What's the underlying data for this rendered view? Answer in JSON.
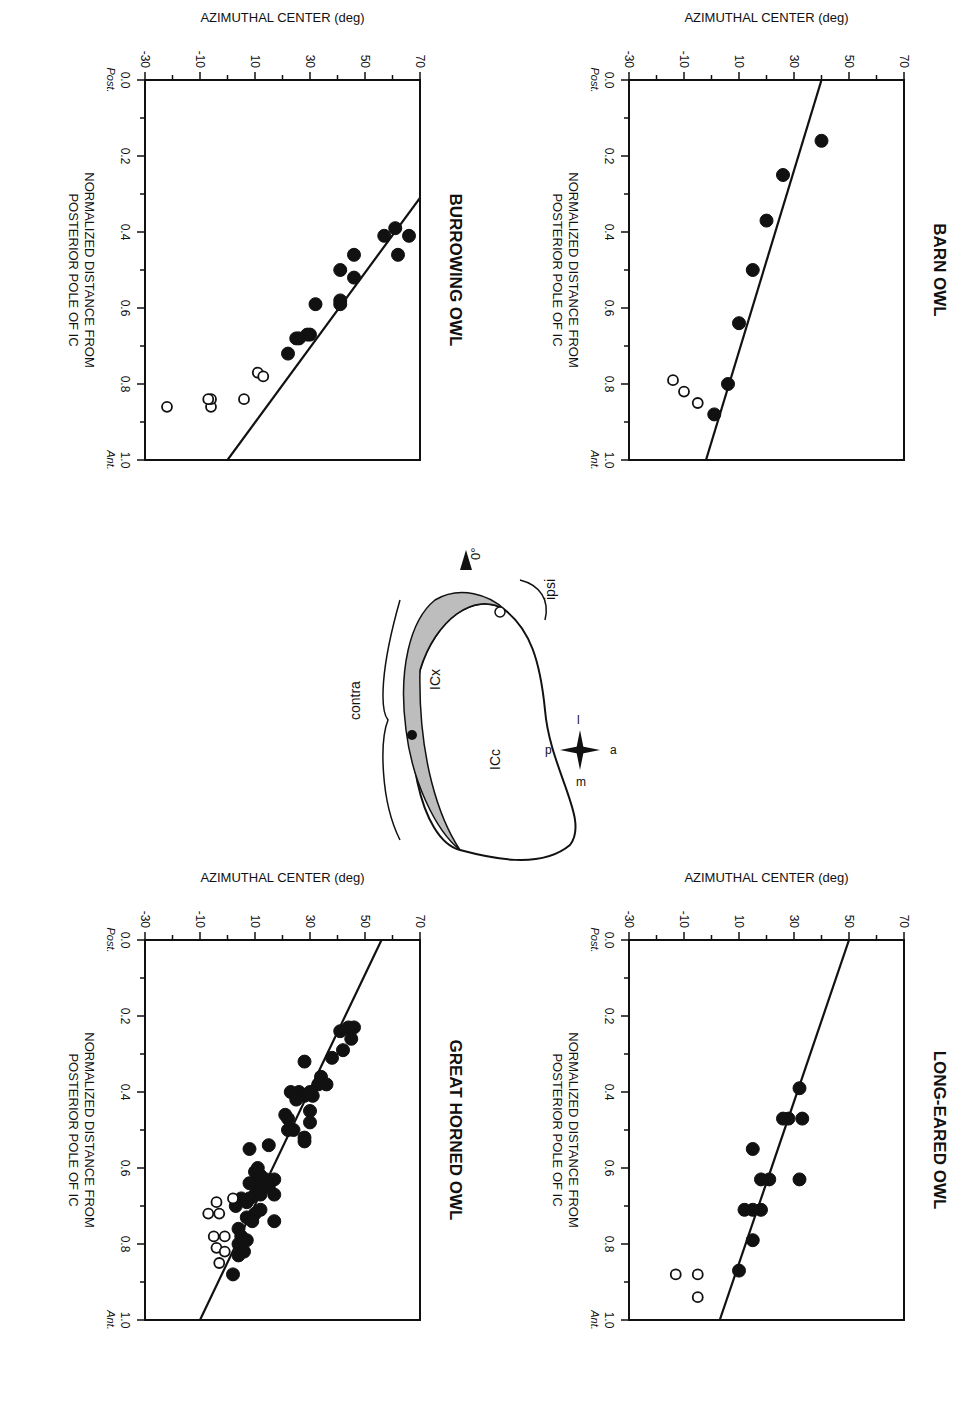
{
  "figure": {
    "orientation": "rotated 90deg clockwise",
    "panels_order": [
      "burrowing_owl",
      "barn_owl",
      "great_horned_owl",
      "long_eared_owl"
    ]
  },
  "axes": {
    "ylabel": "AZIMUTHAL CENTER (deg)",
    "xlabel_line1": "NORMALIZED DISTANCE FROM",
    "xlabel_line2": "POSTERIOR POLE OF IC",
    "y_ticks": [
      "70",
      "50",
      "30",
      "10",
      "-10",
      "-30"
    ],
    "x_ticks": [
      "0.0",
      "0.2",
      "0.4",
      "0.6",
      "0.8",
      "1.0"
    ],
    "x_start_label": "Post.",
    "x_end_label": "Ant."
  },
  "schematic": {
    "contra": "contra",
    "ipsi": "ipsi",
    "icx": "ICx",
    "icc": "ICc",
    "zero_deg": "0°",
    "compass": {
      "a": "a",
      "p": "p",
      "l": "l",
      "m": "m"
    }
  },
  "chart_data": [
    {
      "id": "burrowing_owl",
      "type": "scatter",
      "title": "BURROWING OWL",
      "xlabel": "NORMALIZED DISTANCE FROM POSTERIOR POLE OF IC",
      "ylabel": "AZIMUTHAL CENTER (deg)",
      "xlim": [
        0,
        1
      ],
      "ylim": [
        -30,
        70
      ],
      "x_ticks": [
        0.0,
        0.2,
        0.4,
        0.6,
        0.8,
        1.0
      ],
      "y_ticks": [
        -30,
        -10,
        10,
        30,
        50,
        70
      ],
      "regression_line": {
        "x": [
          0.31,
          1.0
        ],
        "y": [
          70,
          0
        ]
      },
      "series": [
        {
          "name": "filled (ICx contralateral)",
          "marker": "filled",
          "points": [
            [
              0.41,
              66
            ],
            [
              0.46,
              62
            ],
            [
              0.39,
              61
            ],
            [
              0.41,
              57
            ],
            [
              0.46,
              46
            ],
            [
              0.52,
              46
            ],
            [
              0.5,
              41
            ],
            [
              0.58,
              41
            ],
            [
              0.59,
              41
            ],
            [
              0.59,
              32
            ],
            [
              0.67,
              30
            ],
            [
              0.67,
              29
            ],
            [
              0.68,
              26
            ],
            [
              0.68,
              25
            ],
            [
              0.72,
              22
            ]
          ]
        },
        {
          "name": "open (ipsilateral)",
          "marker": "open",
          "points": [
            [
              0.84,
              6
            ],
            [
              0.77,
              11
            ],
            [
              0.78,
              13
            ],
            [
              0.86,
              -6
            ],
            [
              0.84,
              -6
            ],
            [
              0.84,
              -7
            ],
            [
              0.86,
              -22
            ]
          ]
        }
      ]
    },
    {
      "id": "barn_owl",
      "type": "scatter",
      "title": "BARN OWL",
      "xlabel": "NORMALIZED DISTANCE FROM POSTERIOR POLE OF IC",
      "ylabel": "AZIMUTHAL CENTER (deg)",
      "xlim": [
        0,
        1
      ],
      "ylim": [
        -30,
        70
      ],
      "x_ticks": [
        0.0,
        0.2,
        0.4,
        0.6,
        0.8,
        1.0
      ],
      "y_ticks": [
        -30,
        -10,
        10,
        30,
        50,
        70
      ],
      "regression_line": {
        "x": [
          0.0,
          1.0
        ],
        "y": [
          40,
          -2
        ]
      },
      "series": [
        {
          "name": "filled (ICx contralateral)",
          "marker": "filled",
          "points": [
            [
              0.16,
              40
            ],
            [
              0.25,
              26
            ],
            [
              0.37,
              20
            ],
            [
              0.5,
              15
            ],
            [
              0.64,
              10
            ],
            [
              0.8,
              6
            ],
            [
              0.88,
              1
            ]
          ]
        },
        {
          "name": "open (ipsilateral)",
          "marker": "open",
          "points": [
            [
              0.85,
              -5
            ],
            [
              0.82,
              -10
            ],
            [
              0.79,
              -14
            ]
          ]
        }
      ]
    },
    {
      "id": "great_horned_owl",
      "type": "scatter",
      "title": "GREAT HORNED OWL",
      "xlabel": "NORMALIZED DISTANCE FROM POSTERIOR POLE OF IC",
      "ylabel": "AZIMUTHAL CENTER (deg)",
      "xlim": [
        0,
        1
      ],
      "ylim": [
        -30,
        70
      ],
      "x_ticks": [
        0.0,
        0.2,
        0.4,
        0.6,
        0.8,
        1.0
      ],
      "y_ticks": [
        -30,
        -10,
        10,
        30,
        50,
        70
      ],
      "regression_line": {
        "x": [
          0.0,
          1.0
        ],
        "y": [
          56,
          -10
        ]
      },
      "series": [
        {
          "name": "filled (ICx contralateral)",
          "marker": "filled",
          "points": [
            [
              0.23,
              46
            ],
            [
              0.23,
              44
            ],
            [
              0.26,
              45
            ],
            [
              0.24,
              41
            ],
            [
              0.29,
              42
            ],
            [
              0.31,
              38
            ],
            [
              0.32,
              28
            ],
            [
              0.36,
              34
            ],
            [
              0.38,
              36
            ],
            [
              0.38,
              33
            ],
            [
              0.4,
              30
            ],
            [
              0.4,
              26
            ],
            [
              0.41,
              31
            ],
            [
              0.41,
              28
            ],
            [
              0.4,
              23
            ],
            [
              0.42,
              25
            ],
            [
              0.45,
              30
            ],
            [
              0.46,
              21
            ],
            [
              0.47,
              22
            ],
            [
              0.48,
              30
            ],
            [
              0.5,
              24
            ],
            [
              0.5,
              22
            ],
            [
              0.52,
              28
            ],
            [
              0.53,
              28
            ],
            [
              0.54,
              15
            ],
            [
              0.55,
              8
            ],
            [
              0.6,
              11
            ],
            [
              0.61,
              10
            ],
            [
              0.62,
              12
            ],
            [
              0.63,
              17
            ],
            [
              0.63,
              14
            ],
            [
              0.64,
              11
            ],
            [
              0.64,
              8
            ],
            [
              0.65,
              15
            ],
            [
              0.67,
              17
            ],
            [
              0.67,
              12
            ],
            [
              0.67,
              10
            ],
            [
              0.68,
              8
            ],
            [
              0.68,
              5
            ],
            [
              0.69,
              7
            ],
            [
              0.7,
              3
            ],
            [
              0.71,
              12
            ],
            [
              0.72,
              10
            ],
            [
              0.73,
              7
            ],
            [
              0.74,
              17
            ],
            [
              0.74,
              9
            ],
            [
              0.76,
              4
            ],
            [
              0.78,
              5
            ],
            [
              0.79,
              7
            ],
            [
              0.8,
              4
            ],
            [
              0.82,
              6
            ],
            [
              0.83,
              4
            ],
            [
              0.88,
              2
            ]
          ]
        },
        {
          "name": "open (ipsilateral)",
          "marker": "open",
          "points": [
            [
              0.68,
              2
            ],
            [
              0.69,
              -4
            ],
            [
              0.72,
              -3
            ],
            [
              0.72,
              -7
            ],
            [
              0.78,
              -1
            ],
            [
              0.78,
              -5
            ],
            [
              0.81,
              -4
            ],
            [
              0.82,
              -1
            ],
            [
              0.85,
              -3
            ]
          ]
        }
      ]
    },
    {
      "id": "long_eared_owl",
      "type": "scatter",
      "title": "LONG-EARED OWL",
      "xlabel": "NORMALIZED DISTANCE FROM POSTERIOR POLE OF IC",
      "ylabel": "AZIMUTHAL CENTER (deg)",
      "xlim": [
        0,
        1
      ],
      "ylim": [
        -30,
        70
      ],
      "x_ticks": [
        0.0,
        0.2,
        0.4,
        0.6,
        0.8,
        1.0
      ],
      "y_ticks": [
        -30,
        -10,
        10,
        30,
        50,
        70
      ],
      "regression_line": {
        "x": [
          0.0,
          1.0
        ],
        "y": [
          50,
          3
        ]
      },
      "series": [
        {
          "name": "filled (ICx contralateral)",
          "marker": "filled",
          "points": [
            [
              0.39,
              32
            ],
            [
              0.47,
              33
            ],
            [
              0.47,
              28
            ],
            [
              0.47,
              26
            ],
            [
              0.55,
              15
            ],
            [
              0.63,
              32
            ],
            [
              0.63,
              21
            ],
            [
              0.63,
              18
            ],
            [
              0.71,
              18
            ],
            [
              0.71,
              15
            ],
            [
              0.71,
              12
            ],
            [
              0.79,
              15
            ],
            [
              0.87,
              10
            ]
          ]
        },
        {
          "name": "open (ipsilateral)",
          "marker": "open",
          "points": [
            [
              0.94,
              -5
            ],
            [
              0.88,
              -5
            ],
            [
              0.88,
              -13
            ]
          ]
        }
      ]
    }
  ]
}
